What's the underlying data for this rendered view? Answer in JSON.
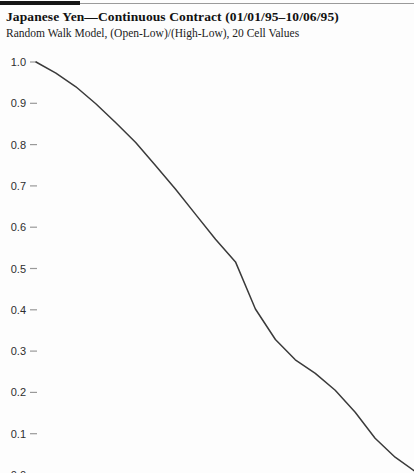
{
  "header": {
    "title": "Japanese Yen—Continuous Contract (01/01/95–10/06/95)",
    "subtitle": "Random Walk Model, (Open-Low)/(High-Low), 20 Cell Values"
  },
  "chart_data": {
    "type": "line",
    "title": "Japanese Yen—Continuous Contract (01/01/95–10/06/95)",
    "subtitle": "Random Walk Model, (Open-Low)/(High-Low), 20 Cell Values",
    "x_label": "",
    "y_label": "",
    "x": [
      1,
      2,
      3,
      4,
      5,
      6,
      7,
      8,
      9,
      10,
      11,
      12,
      13,
      14,
      15,
      16,
      17,
      18,
      19,
      20
    ],
    "values": [
      1.0,
      0.973,
      0.94,
      0.899,
      0.853,
      0.805,
      0.749,
      0.692,
      0.631,
      0.571,
      0.516,
      0.402,
      0.328,
      0.279,
      0.246,
      0.205,
      0.152,
      0.089,
      0.043,
      0.009
    ],
    "y_ticks": [
      1.0,
      0.9,
      0.8,
      0.7,
      0.6,
      0.5,
      0.4,
      0.3,
      0.2,
      0.1,
      0.0
    ],
    "ylim": [
      0.0,
      1.0
    ],
    "grid": false,
    "legend": "none",
    "colors": {
      "curve": "#3a3a3a",
      "tick": "#999999",
      "label": "#2e2e2e",
      "rule_thick": "#151515",
      "rule_thin": "#9a9a9a"
    }
  }
}
